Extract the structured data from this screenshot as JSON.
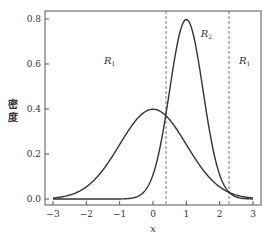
{
  "chart_data": {
    "type": "line",
    "title": "",
    "xlabel": "x",
    "ylabel": "密度",
    "xlim": [
      -3.25,
      3.25
    ],
    "ylim": [
      -0.02,
      0.84
    ],
    "xticks": [
      -3,
      -2,
      -1,
      0,
      1,
      2,
      3
    ],
    "xtick_labels": [
      "−3",
      "−2",
      "−1",
      "0",
      "1",
      "2",
      "3"
    ],
    "yticks": [
      0.0,
      0.2,
      0.4,
      0.6,
      0.8
    ],
    "ytick_labels": [
      "0.0",
      "0.2",
      "0.4",
      "0.6",
      "0.8"
    ],
    "grid": false,
    "legend": null,
    "series": [
      {
        "name": "N(0,1) density",
        "mu": 0,
        "sigma": 1,
        "x_range": [
          -3,
          3
        ],
        "peak": 0.399
      },
      {
        "name": "N(1,0.5²) density",
        "mu": 1,
        "sigma": 0.5,
        "x_range": [
          -3,
          3
        ],
        "peak": 0.798
      }
    ],
    "vlines": [
      {
        "x": 0.39,
        "style": "dashed"
      },
      {
        "x": 2.28,
        "style": "dashed"
      }
    ],
    "annotations": [
      {
        "text": "R",
        "sub": "1",
        "x": -1.3,
        "y": 0.6
      },
      {
        "text": "R",
        "sub": "2",
        "x": 1.6,
        "y": 0.72
      },
      {
        "text": "R",
        "sub": "1",
        "x": 2.75,
        "y": 0.6
      }
    ]
  }
}
